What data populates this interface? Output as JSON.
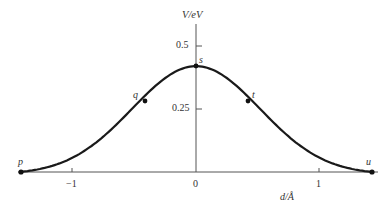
{
  "chart_data": {
    "type": "line",
    "title": "",
    "xlabel": "d/Å",
    "ylabel": "V/eV",
    "xlim": [
      -1.43,
      1.43
    ],
    "ylim": [
      0,
      0.55
    ],
    "x_ticks": [
      -1,
      0,
      1
    ],
    "x_tick_labels": [
      "−1",
      "0",
      "1"
    ],
    "y_ticks": [
      0.25,
      0.5
    ],
    "y_tick_labels": [
      "0.25",
      "0.5"
    ],
    "grid": false,
    "legend": null,
    "series": [
      {
        "name": "potential energy curve",
        "x": [
          -1.43,
          -1.2,
          -1.0,
          -0.8,
          -0.6,
          -0.41,
          -0.2,
          0.0,
          0.2,
          0.42,
          0.6,
          0.8,
          1.0,
          1.2,
          1.43
        ],
        "values": [
          0.0,
          0.02,
          0.05,
          0.1,
          0.18,
          0.28,
          0.37,
          0.42,
          0.37,
          0.28,
          0.18,
          0.1,
          0.05,
          0.02,
          0.0
        ]
      }
    ],
    "annotations": [
      {
        "label": "p",
        "x": -1.43,
        "y": 0.0
      },
      {
        "label": "q",
        "x": -0.41,
        "y": 0.28
      },
      {
        "label": "s",
        "x": 0.0,
        "y": 0.42
      },
      {
        "label": "t",
        "x": 0.42,
        "y": 0.28
      },
      {
        "label": "u",
        "x": 1.43,
        "y": 0.0
      }
    ]
  },
  "labels": {
    "ylabel": "V/eV",
    "xlabel": "d/Å",
    "y_tick_05": "0.5",
    "y_tick_025": "0.25",
    "x_tick_m1": "−1",
    "x_tick_0": "0",
    "x_tick_1": "1",
    "p": "p",
    "q": "q",
    "s": "s",
    "t": "t",
    "u": "u"
  }
}
